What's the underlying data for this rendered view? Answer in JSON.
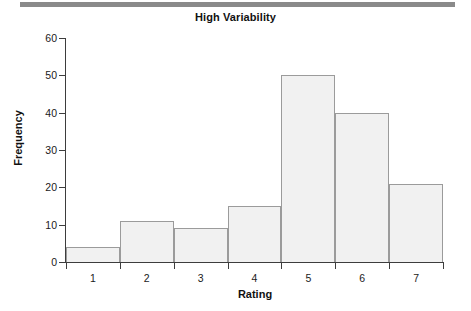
{
  "chart_data": {
    "type": "bar",
    "title": "High Variability",
    "xlabel": "Rating",
    "ylabel": "Frequency",
    "categories": [
      "1",
      "2",
      "3",
      "4",
      "5",
      "6",
      "7"
    ],
    "values": [
      4,
      11,
      9,
      15,
      50,
      40,
      21
    ],
    "ylim": [
      0,
      60
    ],
    "yticks": [
      0,
      10,
      20,
      30,
      40,
      50,
      60
    ],
    "ytick_labels": [
      "0",
      "10",
      "20",
      "30",
      "40",
      "50",
      "60"
    ],
    "xtick_labels": [
      "1",
      "2",
      "3",
      "4",
      "5",
      "6",
      "7"
    ],
    "grid": false,
    "legend": false,
    "bar_fill_color": "#f1f1f1",
    "bar_border_color": "#9b9b9b",
    "axis_color": "#3d3d3d",
    "background_color": "#ffffff"
  },
  "decorations": {
    "top_rule_color": "#8a8a8a"
  }
}
